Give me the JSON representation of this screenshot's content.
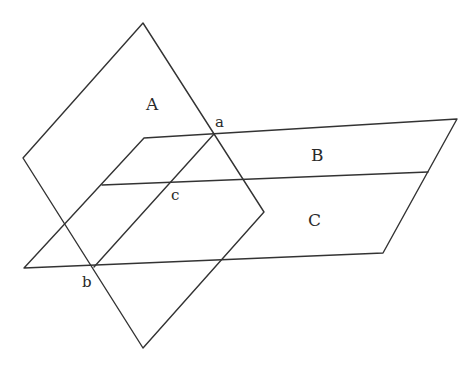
{
  "diagram": {
    "type": "intersecting-planes",
    "colors": {
      "stroke": "#333333",
      "background": "#ffffff",
      "text": "#2a2a2a"
    },
    "plane_labels": {
      "A": "A",
      "B": "B",
      "C": "C"
    },
    "point_labels": {
      "a": "a",
      "b": "b",
      "c": "c"
    },
    "planes": [
      {
        "name": "A",
        "shape": "rhombus",
        "vertices": [
          [
            143,
            23
          ],
          [
            264,
            212
          ],
          [
            143,
            348
          ],
          [
            23,
            158
          ]
        ]
      },
      {
        "name": "horizontal-parallelogram",
        "vertices": [
          [
            144,
            138
          ],
          [
            457,
            119
          ],
          [
            383,
            253
          ],
          [
            24,
            268
          ]
        ]
      }
    ],
    "lines": [
      {
        "name": "B-C-divider",
        "from": [
          102,
          185
        ],
        "to": [
          428,
          172
        ]
      },
      {
        "name": "line-ab",
        "from": [
          214,
          134
        ],
        "to": [
          94,
          267
        ]
      }
    ]
  }
}
